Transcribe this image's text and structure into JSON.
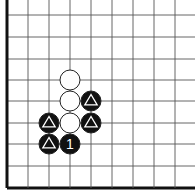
{
  "board": {
    "caption": "",
    "grid": {
      "x_lines": [
        7,
        28,
        49,
        70,
        91,
        112,
        133,
        154,
        175
      ],
      "y_lines": [
        15,
        37,
        59,
        80,
        101,
        123,
        144,
        166,
        188
      ],
      "thick_left": true,
      "thick_bottom": true,
      "line_color": "#555555",
      "edge_color": "#111111"
    },
    "stone_radius": 10,
    "stones": [
      {
        "color": "white",
        "col": 3,
        "row": 3,
        "mark": ""
      },
      {
        "color": "white",
        "col": 3,
        "row": 4,
        "mark": ""
      },
      {
        "color": "white",
        "col": 3,
        "row": 5,
        "mark": ""
      },
      {
        "color": "black",
        "col": 4,
        "row": 4,
        "mark": "triangle"
      },
      {
        "color": "black",
        "col": 4,
        "row": 5,
        "mark": "triangle"
      },
      {
        "color": "black",
        "col": 2,
        "row": 5,
        "mark": "triangle"
      },
      {
        "color": "black",
        "col": 2,
        "row": 6,
        "mark": "triangle"
      },
      {
        "color": "black",
        "col": 3,
        "row": 6,
        "mark": "1"
      }
    ]
  }
}
